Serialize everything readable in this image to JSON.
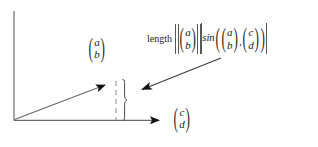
{
  "figure": {
    "background_color": "#ffffff",
    "stroke_color": "#555555",
    "arrow_color": "#111111",
    "text_color": "#1a1a1a",
    "bar_color": "#585858"
  },
  "annotation": {
    "length_word": "length",
    "sin_word": "sin",
    "separator": ",",
    "norm_vector": {
      "top": "a",
      "bottom": "b"
    },
    "sin_first_vector": {
      "top": "a",
      "bottom": "b"
    },
    "sin_second_vector": {
      "top": "c",
      "bottom": "d"
    },
    "plain_text": "length ||(a b)|| |sin((a b),(c d))|"
  },
  "labels": {
    "vector_ab": {
      "top": "a",
      "bottom": "b"
    },
    "vector_cd": {
      "top": "c",
      "bottom": "d"
    }
  },
  "parens": {
    "left": "(",
    "right": ")"
  },
  "geometry": {
    "origin": {
      "x": 14,
      "y": 120
    },
    "y_axis_top": {
      "x": 14,
      "y": 11
    },
    "x_axis_end": {
      "x": 168,
      "y": 120
    },
    "vector_ab_tip": {
      "x": 114,
      "y": 82
    },
    "drop_line_x": 116,
    "brace_x": 125,
    "brace_top": 79,
    "brace_bottom": 121,
    "pointer_start": {
      "x": 221,
      "y": 58
    },
    "pointer_end": {
      "x": 133,
      "y": 93
    }
  }
}
